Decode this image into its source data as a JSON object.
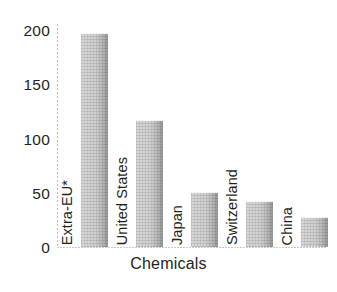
{
  "chart_data": {
    "type": "bar",
    "title": "",
    "subtitle": "",
    "xlabel": "Chemicals",
    "ylabel": "",
    "categories": [
      "Extra-EU*",
      "United States",
      "Japan",
      "Switzerland",
      "China"
    ],
    "values": [
      192,
      114,
      49,
      41,
      27
    ],
    "series": [
      {
        "name": "Chemicals",
        "values": [
          192,
          114,
          49,
          41,
          27
        ]
      }
    ],
    "ylim": [
      0,
      200
    ],
    "yticks": [
      "0",
      "50",
      "100",
      "150",
      "200"
    ],
    "ytick_values": [
      0,
      50,
      100,
      150,
      200
    ],
    "grid": false,
    "legend": false,
    "legend_position": "none",
    "orientation": "vertical",
    "bar_color": "#e3e3e3",
    "bar_edge_color": "#a8a8a8",
    "axis_color": "#c9c9c9",
    "text_color": "#231f20",
    "background": "#ffffff",
    "category_label_rotation": 90,
    "category_label_placement": "inside-left-of-bar",
    "annotations": [
      "* Extra-EU denotes trade outside the European Union"
    ]
  },
  "axis": {
    "x_title": "Chemicals",
    "y_ticks": [
      {
        "label": "200",
        "value": 200
      },
      {
        "label": "150",
        "value": 150
      },
      {
        "label": "100",
        "value": 100
      },
      {
        "label": "50",
        "value": 50
      },
      {
        "label": "0",
        "value": 0
      }
    ]
  },
  "bars": [
    {
      "label": "Extra-EU*",
      "value": 192
    },
    {
      "label": "United States",
      "value": 114
    },
    {
      "label": "Japan",
      "value": 49
    },
    {
      "label": "Switzerland",
      "value": 41
    },
    {
      "label": "China",
      "value": 27
    }
  ]
}
